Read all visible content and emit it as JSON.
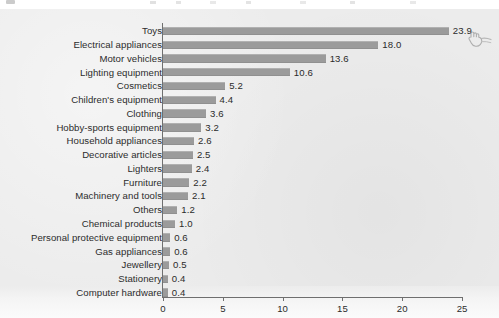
{
  "chart_data": {
    "type": "bar",
    "orientation": "horizontal",
    "title": "",
    "subtitle": "",
    "xlabel": "",
    "ylabel": "",
    "xlim": [
      0,
      25
    ],
    "xticks": [
      0,
      5,
      10,
      15,
      20,
      25
    ],
    "xtick_labels": [
      "0",
      "5",
      "10",
      "15",
      "20",
      "25"
    ],
    "grid": false,
    "legend": null,
    "bar_color": "#9b9b9b",
    "plot_background": "#ececec",
    "categories": [
      "Toys",
      "Electrical appliances",
      "Motor vehicles",
      "Lighting equipment",
      "Cosmetics",
      "Children's equipment",
      "Clothing",
      "Hobby-sports equipment",
      "Household appliances",
      "Decorative articles",
      "Lighters",
      "Furniture",
      "Machinery and tools",
      "Others",
      "Chemical products",
      "Personal protective equipment",
      "Gas appliances",
      "Jewellery",
      "Stationery",
      "Computer hardware"
    ],
    "values": [
      23.9,
      18.0,
      13.6,
      10.6,
      5.2,
      4.4,
      3.6,
      3.2,
      2.6,
      2.5,
      2.4,
      2.2,
      2.1,
      1.2,
      1.0,
      0.6,
      0.6,
      0.5,
      0.4,
      0.4
    ],
    "value_labels": [
      "23.9",
      "18.0",
      "13.6",
      "10.6",
      "5.2",
      "4.4",
      "3.6",
      "3.2",
      "2.6",
      "2.5",
      "2.4",
      "2.2",
      "2.1",
      "1.2",
      "1.0",
      "0.6",
      "0.6",
      "0.5",
      "0.4",
      "0.4"
    ]
  },
  "annotations": {
    "cursor_icon": "hand-pointer-cursor"
  }
}
